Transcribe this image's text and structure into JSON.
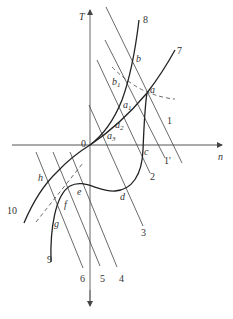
{
  "axes": {
    "y_label": "T",
    "x_label": "n",
    "origin_label": "0"
  },
  "curve_labels": {
    "c7": "7",
    "c8": "8",
    "c9": "9",
    "c10": "10"
  },
  "line_labels": {
    "l1": "1",
    "l1p": "1'",
    "l2": "2",
    "l3": "3",
    "l4": "4",
    "l5": "5",
    "l6": "6"
  },
  "point_labels": {
    "a": "a",
    "b": "b",
    "b1": "b",
    "b1_sub": "1",
    "a1": "a",
    "a1_sub": "1",
    "a2": "a",
    "a2_sub": "2",
    "a3": "a",
    "a3_sub": "3",
    "c": "c",
    "d": "d",
    "e": "e",
    "f": "f",
    "g": "g",
    "h": "h"
  },
  "colors": {
    "stroke": "#333333",
    "axis": "#555555",
    "background": "#ffffff"
  }
}
